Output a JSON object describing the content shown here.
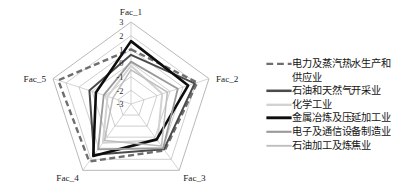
{
  "chart_data": {
    "type": "radar",
    "title": "",
    "categories": [
      "Fac_1",
      "Fac_2",
      "Fac_3",
      "Fac_4",
      "Fac_5"
    ],
    "tick_labels": [
      "3",
      "2",
      "1",
      "0",
      "-1",
      "-2",
      "-3"
    ],
    "rlim": [
      -3,
      3
    ],
    "grid": true,
    "legend_position": "right",
    "series": [
      {
        "name": "电力及蒸汽热水生产和供应业",
        "values": [
          1.0,
          2.1,
          1.2,
          2.2,
          2.6
        ],
        "color": "#6e6e6e",
        "style": "dashed",
        "width": 2.4
      },
      {
        "name": "石油和天然气开采业",
        "values": [
          0.6,
          1.9,
          1.1,
          1.6,
          0.2
        ],
        "color": "#4a4a4a",
        "style": "solid",
        "width": 2.0
      },
      {
        "name": "化学工业",
        "values": [
          -0.2,
          -0.6,
          0.3,
          0.5,
          -1.2
        ],
        "color": "#d2d2d2",
        "style": "solid",
        "width": 2.0
      },
      {
        "name": "金属冶炼及压延加工业",
        "values": [
          1.6,
          1.4,
          0.2,
          1.7,
          -0.3
        ],
        "color": "#0d0d0d",
        "style": "solid",
        "width": 2.6
      },
      {
        "name": "电子及通信设备制造业",
        "values": [
          0.1,
          0.6,
          1.0,
          1.1,
          -0.9
        ],
        "color": "#9a9a9a",
        "style": "solid",
        "width": 1.8
      },
      {
        "name": "石油加工及炼焦业",
        "values": [
          -0.5,
          -0.2,
          0.8,
          0.3,
          -1.6
        ],
        "color": "#bdbdbd",
        "style": "solid",
        "width": 1.5
      }
    ]
  },
  "axes": {
    "fac_1": "Fac_1",
    "fac_2": "Fac_2",
    "fac_3": "Fac_3",
    "fac_4": "Fac_4",
    "fac_5": "Fac_5"
  },
  "ticks": {
    "t0": "3",
    "t1": "2",
    "t2": "1",
    "t3": "0",
    "t4": "-1",
    "t5": "-2",
    "t6": "-3"
  },
  "legend": {
    "items": [
      {
        "label_line1": "电力及蒸汽热水生产和",
        "label_line2": "供应业"
      },
      {
        "label_line1": "石油和天然气开采业"
      },
      {
        "label_line1": "化学工业"
      },
      {
        "label_line1": "金属冶炼及压延加工业"
      },
      {
        "label_line1": "电子及通信设备制造业"
      },
      {
        "label_line1": "石油加工及炼焦业"
      }
    ]
  }
}
